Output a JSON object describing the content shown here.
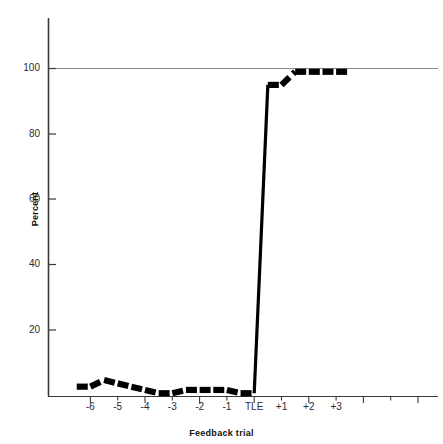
{
  "chart_data": {
    "type": "line",
    "title": "",
    "subtitle": "",
    "xlabel": "Feedback trial",
    "ylabel": "Percent",
    "xlim": [
      -6.8,
      3.8
    ],
    "ylim": [
      0,
      108
    ],
    "ytick_values": [
      20,
      40,
      60,
      80,
      100
    ],
    "ytick_labels": [
      "20",
      "40",
      "60",
      "80",
      "100"
    ],
    "xtick_values": [
      -6,
      -5,
      -4,
      -3,
      -2,
      -1,
      0,
      1,
      2,
      3
    ],
    "xtick_labels": [
      "-6",
      "-5",
      "-4",
      "-3",
      "-2",
      "-1",
      "TLE",
      "+1",
      "+2",
      "+3"
    ],
    "minor_xticks": true,
    "grid": "single horizontal rule at y=100",
    "gridline_values": [
      100
    ],
    "line_style": "thick black dashed with solid vertical transition",
    "x": [
      -6.5,
      -6.0,
      -5.5,
      -5.0,
      -4.5,
      -4.0,
      -3.5,
      -3.0,
      -2.5,
      -2.0,
      -1.5,
      -1.0,
      -0.5,
      0.0,
      0.5,
      1.0,
      1.5,
      2.0,
      2.5,
      3.0,
      3.5
    ],
    "values": [
      3,
      3,
      5,
      4,
      3,
      2,
      1,
      1,
      2,
      2,
      2,
      2,
      1,
      1,
      95,
      95,
      99,
      99,
      99,
      99,
      99
    ],
    "series": [
      {
        "name": "Percent correct",
        "values": [
          3,
          3,
          5,
          4,
          3,
          2,
          1,
          1,
          2,
          2,
          2,
          2,
          1,
          1,
          95,
          95,
          99,
          99,
          99,
          99,
          99
        ]
      }
    ],
    "annotations": [
      "Near-zero performance across feedback trials -6 through -1",
      "Abrupt near-vertical rise at TLE (trial of last error)",
      "Asymptotic performance near 99-100 percent from +1 onward"
    ],
    "legend": [],
    "legend_position": "none",
    "colors": {
      "line": "#000000",
      "axis": "#3a3a3a",
      "gridline": "#7a7a7a",
      "background": "#ffffff",
      "text": "#1a1a1a"
    }
  },
  "axes": {
    "y_title": "Percent",
    "x_title": "Feedback trial"
  }
}
